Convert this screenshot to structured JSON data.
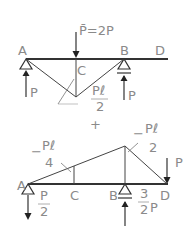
{
  "upper": {
    "load_label": "P̄=2P",
    "points": {
      "A": "A",
      "B": "B",
      "C": "C",
      "D": "D"
    },
    "reaction_A": "P",
    "reaction_B": "P",
    "moment_num": "Pℓ",
    "moment_den": "2"
  },
  "operator": "+",
  "lower": {
    "points": {
      "A": "A",
      "B": "B",
      "C": "C",
      "D": "D"
    },
    "load_D": "P",
    "reaction_A_num": "P",
    "reaction_A_den": "2",
    "reaction_B_num": "3",
    "reaction_B_den": "2",
    "reaction_B_suffix": "P",
    "moment_C_sign": "−",
    "moment_C_num": "Pℓ",
    "moment_C_den": "4",
    "moment_B_sign": "−",
    "moment_B_num": "Pℓ",
    "moment_B_den": "2"
  }
}
